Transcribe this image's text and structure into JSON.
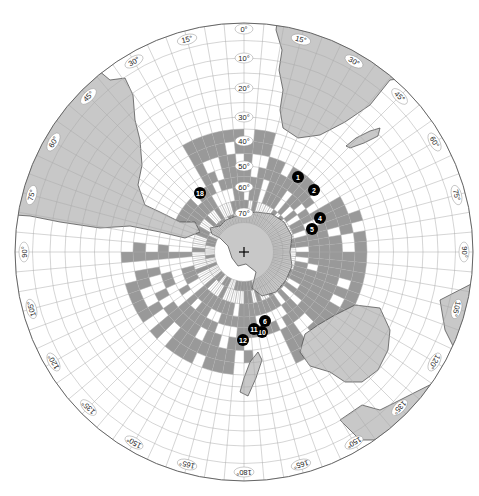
{
  "map": {
    "projection": "south-polar-azimuthal",
    "center_marker": "+",
    "colors": {
      "land": "#c8c8c8",
      "land_stroke": "#444444",
      "shaded_cell": "#999999",
      "grid": "#aaaaaa",
      "marker_fill": "#000000",
      "marker_text": "#ffffff",
      "outline": "#666666"
    },
    "latitude_labels": [
      "0°",
      "10°",
      "20°",
      "30°",
      "40°",
      "50°",
      "60°",
      "70°"
    ],
    "longitude_labels": [
      {
        "text": "0°",
        "angle": 0
      },
      {
        "text": "15°",
        "angle": 15
      },
      {
        "text": "30°",
        "angle": 30
      },
      {
        "text": "45°",
        "angle": 45
      },
      {
        "text": "60°",
        "angle": 60
      },
      {
        "text": "75°",
        "angle": 75
      },
      {
        "text": "90°",
        "angle": 90
      },
      {
        "text": "105°",
        "angle": 105
      },
      {
        "text": "120°",
        "angle": 120
      },
      {
        "text": "135°",
        "angle": 135
      },
      {
        "text": "150°",
        "angle": 150
      },
      {
        "text": "165°",
        "angle": 165
      },
      {
        "text": "180°",
        "angle": 180
      },
      {
        "text": "165°",
        "angle": 195
      },
      {
        "text": "150°",
        "angle": 210
      },
      {
        "text": "135°",
        "angle": 225
      },
      {
        "text": "120°",
        "angle": 240
      },
      {
        "text": "105°",
        "angle": 255
      },
      {
        "text": "90°",
        "angle": 270
      },
      {
        "text": "75°",
        "angle": 285
      },
      {
        "text": "60°",
        "angle": 300
      },
      {
        "text": "45°",
        "angle": 315
      },
      {
        "text": "30°",
        "angle": 330
      },
      {
        "text": "15°",
        "angle": 345
      }
    ],
    "markers": [
      {
        "id": "1",
        "x": 298,
        "y": 177
      },
      {
        "id": "2",
        "x": 314,
        "y": 190
      },
      {
        "id": "4",
        "x": 320,
        "y": 218
      },
      {
        "id": "5",
        "x": 312,
        "y": 229
      },
      {
        "id": "6",
        "x": 265,
        "y": 321
      },
      {
        "id": "10",
        "x": 262,
        "y": 332
      },
      {
        "id": "11",
        "x": 254,
        "y": 329
      },
      {
        "id": "12",
        "x": 243,
        "y": 340
      },
      {
        "id": "18",
        "x": 200,
        "y": 193
      }
    ]
  }
}
